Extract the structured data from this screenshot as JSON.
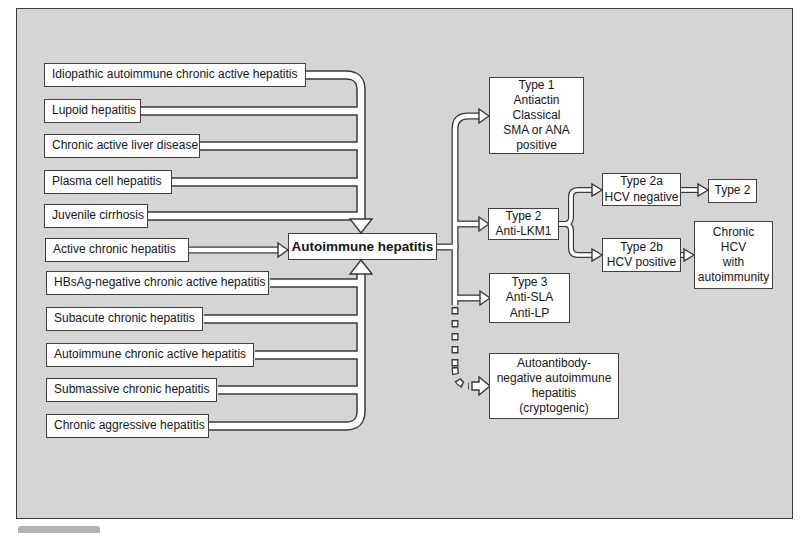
{
  "colors": {
    "canvas_background": "#d5d5d5",
    "box_background": "#ffffff",
    "line_color": "#383838"
  },
  "left_boxes": [
    {
      "label": "Idiopathic autoimmune chronic active hepatitis"
    },
    {
      "label": "Lupoid hepatitis"
    },
    {
      "label": "Chronic active liver disease"
    },
    {
      "label": "Plasma cell hepatitis"
    },
    {
      "label": "Juvenile cirrhosis"
    },
    {
      "label": "Active chronic hepatitis"
    },
    {
      "label": "HBsAg-negative chronic active hepatitis"
    },
    {
      "label": "Subacute chronic hepatitis"
    },
    {
      "label": "Autoimmune chronic active hepatitis"
    },
    {
      "label": "Submassive chronic hepatitis"
    },
    {
      "label": "Chronic aggressive hepatitis"
    }
  ],
  "center_box": {
    "label": "Autoimmune hepatitis"
  },
  "right_boxes": {
    "type1": {
      "label": "Type 1\nAntiactin\nClassical\nSMA or ANA\npositive"
    },
    "type2": {
      "label": "Type 2\nAnti-LKM1"
    },
    "type2a": {
      "label": "Type 2a\nHCV negative"
    },
    "type2_outcome": {
      "label": "Type 2"
    },
    "type2b": {
      "label": "Type 2b\nHCV positive"
    },
    "chronic_hcv": {
      "label": "Chronic\nHCV\nwith\nautoimmunity"
    },
    "type3": {
      "label": "Type 3\nAnti-SLA\nAnti-LP"
    },
    "autoantibody_negative": {
      "label": "Autoantibody-\nnegative autoimmune\nhepatitis\n(cryptogenic)"
    }
  }
}
